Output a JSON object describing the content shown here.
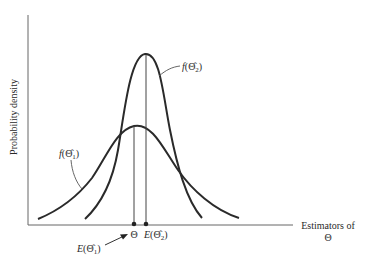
{
  "diagram": {
    "y_axis_label": "Probability density",
    "x_axis_label_line1": "Estimators of",
    "x_axis_label_line2": "Θ",
    "curves": [
      {
        "id": "f1",
        "label_func": "f",
        "label_symbol": "Θ̂",
        "label_sub": "1",
        "description": "wider distribution centered at Θ (unbiased estimator)"
      },
      {
        "id": "f2",
        "label_func": "f",
        "label_symbol": "Θ̂",
        "label_sub": "2",
        "description": "narrower, taller distribution centered at E(Θ̂2) (biased, lower variance)"
      }
    ],
    "markers": [
      {
        "id": "theta",
        "label": "Θ"
      },
      {
        "id": "e2",
        "label_func": "E",
        "label_symbol": "Θ̂",
        "label_sub": "2"
      }
    ],
    "arrow_label": {
      "label_func": "E",
      "label_symbol": "Θ̂",
      "label_sub": "1"
    },
    "colors": {
      "line": "#2a2a2a",
      "axis": "#555555",
      "background": "#ffffff"
    }
  }
}
